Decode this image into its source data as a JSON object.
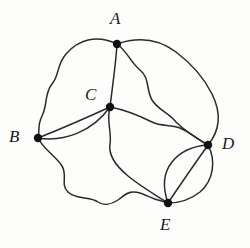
{
  "figure": {
    "kind": "undirected-multigraph-drawing",
    "background_color": "#fdfdfc",
    "stroke_color": "#2a2a2a",
    "vertex_fill_color": "#111111",
    "caption": ""
  },
  "graph": {
    "vertices": [
      {
        "id": "A",
        "label": "A",
        "x": 117,
        "y": 44,
        "label_x": 110,
        "label_y": 10,
        "degree": 4
      },
      {
        "id": "B",
        "label": "B",
        "x": 38,
        "y": 138,
        "label_x": 9,
        "label_y": 128,
        "degree": 4
      },
      {
        "id": "C",
        "label": "C",
        "x": 110,
        "y": 107,
        "label_x": 85,
        "label_y": 86,
        "degree": 5
      },
      {
        "id": "D",
        "label": "D",
        "x": 208,
        "y": 145,
        "label_x": 222,
        "label_y": 135,
        "degree": 6
      },
      {
        "id": "E",
        "label": "E",
        "x": 168,
        "y": 203,
        "label_x": 160,
        "label_y": 216,
        "degree": 5
      }
    ],
    "edges": [
      {
        "id": "e-AB",
        "from": "A",
        "to": "B",
        "style": "wavy-outer-left",
        "path": "M117,44 C96,34 78,40 66,54 C56,66 60,74 52,84 C44,94 48,104 42,116 C37,126 40,131 38,138"
      },
      {
        "id": "e-AC",
        "from": "A",
        "to": "C",
        "style": "near-straight",
        "path": "M117,44 C116,62 113,82 110,107"
      },
      {
        "id": "e-AD1",
        "from": "A",
        "to": "D",
        "style": "wavy-outer-right",
        "path": "M117,44 C140,36 160,40 176,52 C192,64 204,78 212,94 C220,110 222,128 208,145"
      },
      {
        "id": "e-AD2",
        "from": "A",
        "to": "D",
        "style": "wavy-inner-right",
        "path": "M117,44 C128,52 130,62 140,70 C150,78 146,90 152,100 C158,110 168,112 176,122 C186,132 196,138 208,145"
      },
      {
        "id": "e-BC1",
        "from": "B",
        "to": "C",
        "style": "chord-straight",
        "path": "M38,138 C58,130 86,118 110,107"
      },
      {
        "id": "e-BC2",
        "from": "B",
        "to": "C",
        "style": "bowed-below",
        "path": "M38,138 C64,142 92,132 110,107"
      },
      {
        "id": "e-BE",
        "from": "B",
        "to": "E",
        "style": "wiggly-bottom",
        "path": "M38,138 C44,150 56,156 62,166 C68,176 60,184 68,192 C76,200 90,196 98,202 C104,206 112,204 118,200 C124,196 126,192 134,192 C142,192 150,198 158,200 C162,201 165,202 168,203"
      },
      {
        "id": "e-CD",
        "from": "C",
        "to": "D",
        "style": "wavy-middle",
        "path": "M110,107 C126,110 140,116 152,122 C162,127 170,124 180,128 C190,132 198,140 208,145"
      },
      {
        "id": "e-CE",
        "from": "C",
        "to": "E",
        "style": "wiggly-down",
        "path": "M110,107 C106,120 112,132 110,144 C108,156 116,166 128,176 C140,186 154,194 168,203"
      },
      {
        "id": "e-DE1",
        "from": "D",
        "to": "E",
        "style": "bowed-left",
        "path": "M208,145 C192,146 180,152 172,162 C164,172 162,186 168,203"
      },
      {
        "id": "e-DE2",
        "from": "D",
        "to": "E",
        "style": "near-straight",
        "path": "M208,145 C196,162 182,182 168,203"
      },
      {
        "id": "e-DE3",
        "from": "D",
        "to": "E",
        "style": "bowed-right-outer",
        "path": "M208,145 C216,160 214,180 200,192 C190,200 178,203 168,203"
      }
    ],
    "edge_count": 12,
    "vertex_count": 5,
    "multi_edges": [
      {
        "pair": "A-D",
        "multiplicity": 2
      },
      {
        "pair": "B-C",
        "multiplicity": 2
      },
      {
        "pair": "D-E",
        "multiplicity": 3
      }
    ]
  }
}
